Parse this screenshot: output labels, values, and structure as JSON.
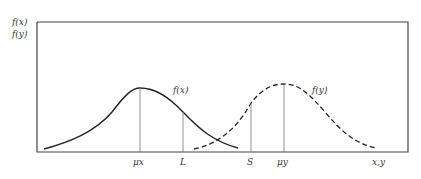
{
  "diagram": {
    "y_axis_labels": [
      "f(x)",
      "f(y)"
    ],
    "x_axis_label": "x,y",
    "curves": [
      {
        "name": "f(x)",
        "label": "f(x)",
        "style": "solid",
        "mean_label": "μx"
      },
      {
        "name": "f(y)",
        "label": "f(y)",
        "style": "dashed",
        "mean_label": "μy"
      }
    ],
    "markers": [
      {
        "label": "μx",
        "position": "mean of f(x)"
      },
      {
        "label": "L",
        "position": "right of μx"
      },
      {
        "label": "S",
        "position": "left of μy"
      },
      {
        "label": "μy",
        "position": "mean of f(y)"
      }
    ],
    "colors": {
      "line": "#222222",
      "marker": "#777777",
      "frame": "#444444"
    }
  }
}
